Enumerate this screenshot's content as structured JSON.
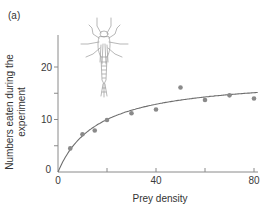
{
  "figure": {
    "panel_label": "(a)",
    "illustration": "damselfly-nymph-icon"
  },
  "chart_data": {
    "type": "scatter",
    "title": "",
    "xlabel": "Prey density",
    "ylabel": "Numbers eaten during the experiment",
    "ylabel_lines": [
      "Numbers eaten during the",
      "experiment"
    ],
    "xlim": [
      0,
      82
    ],
    "ylim": [
      0,
      26
    ],
    "xticks": [
      0,
      20,
      40,
      60,
      80
    ],
    "xtick_labels": [
      "0",
      "",
      "40",
      "",
      "80"
    ],
    "yticks": [
      0,
      5,
      10,
      15,
      20
    ],
    "ytick_labels": [
      "0",
      "",
      "10",
      "",
      "20"
    ],
    "grid": false,
    "legend": null,
    "series": [
      {
        "name": "observed",
        "kind": "points",
        "color": "#8a8a8a",
        "x": [
          5,
          10,
          15,
          20,
          30,
          40,
          50,
          60,
          70,
          80
        ],
        "y": [
          4.5,
          7.2,
          7.9,
          9.9,
          11.2,
          11.9,
          16.1,
          13.7,
          14.6,
          14.0
        ]
      },
      {
        "name": "fitted type II functional response",
        "kind": "curve",
        "color": "#6e6e6e",
        "equation": "y = 1.11x / (1 + 0.061x)",
        "x": [
          0,
          5,
          10,
          20,
          30,
          40,
          50,
          60,
          70,
          80,
          81.5
        ],
        "y": [
          0,
          4.25,
          6.9,
          10.0,
          11.7,
          12.9,
          13.6,
          14.2,
          14.7,
          15.0,
          15.1
        ]
      }
    ]
  },
  "colors": {
    "axis": "#8a8a8a",
    "points": "#8a8a8a",
    "curve": "#6e6e6e",
    "illustration": "#9a9a9a"
  }
}
